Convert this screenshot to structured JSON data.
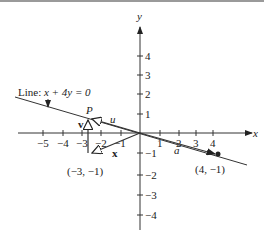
{
  "figure": {
    "axis_labels": {
      "x": "x",
      "y": "y"
    },
    "x_ticks": [
      {
        "value": -5,
        "label": "−5"
      },
      {
        "value": -4,
        "label": "−4"
      },
      {
        "value": -3,
        "label": "−3"
      },
      {
        "value": -2,
        "label": "−2"
      },
      {
        "value": -1,
        "label": "−1"
      },
      {
        "value": 1,
        "label": "1"
      },
      {
        "value": 2,
        "label": "2"
      },
      {
        "value": 3,
        "label": "3"
      },
      {
        "value": 4,
        "label": "4"
      }
    ],
    "y_ticks": [
      {
        "value": 4,
        "label": "4"
      },
      {
        "value": 3,
        "label": "3"
      },
      {
        "value": 2,
        "label": "2"
      },
      {
        "value": 1,
        "label": "1"
      },
      {
        "value": -1,
        "label": "−1"
      },
      {
        "value": -2,
        "label": "−2"
      },
      {
        "value": -3,
        "label": "−3"
      },
      {
        "value": -4,
        "label": "−4"
      }
    ],
    "line_label_prefix": "Line: ",
    "line_equation": "x + 4y = 0",
    "point_P_label": "P",
    "vector_u_label": "u",
    "vector_v_label": "v",
    "vector_x_label": "x",
    "vector_a_label": "a",
    "point_neg3_neg1_label": "(−3, −1)",
    "point_4_neg1_label": "(4, −1)"
  }
}
